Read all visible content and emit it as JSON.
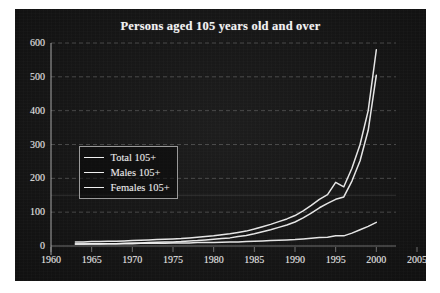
{
  "figure": {
    "background_color": "#ffffff",
    "panel_color": "#151515",
    "ink_color": "#f0f0f0"
  },
  "legend": {
    "position": "inner-left",
    "entries": [
      {
        "label": "Total 105+",
        "color": "#f0f0f0"
      },
      {
        "label": "Males 105+",
        "color": "#f0f0f0"
      },
      {
        "label": "Females 105+",
        "color": "#f0f0f0"
      }
    ]
  },
  "chart_data": {
    "type": "line",
    "title": "Persons aged 105 years old and over",
    "xlabel": "",
    "ylabel": "",
    "xlim": [
      1960,
      2005
    ],
    "ylim": [
      0,
      600
    ],
    "xticks": [
      1960,
      1965,
      1970,
      1975,
      1980,
      1985,
      1990,
      1995,
      2000,
      2005
    ],
    "yticks": [
      0,
      100,
      200,
      300,
      400,
      500,
      600
    ],
    "grid": true,
    "grid_style": "dashed-horizontal",
    "legend_position": "inner-left",
    "x": [
      1963,
      1964,
      1965,
      1966,
      1967,
      1968,
      1969,
      1970,
      1971,
      1972,
      1973,
      1974,
      1975,
      1976,
      1977,
      1978,
      1979,
      1980,
      1981,
      1982,
      1983,
      1984,
      1985,
      1986,
      1987,
      1988,
      1989,
      1990,
      1991,
      1992,
      1993,
      1994,
      1995,
      1996,
      1997,
      1998,
      1999,
      2000
    ],
    "series": [
      {
        "name": "Total 105+",
        "values": [
          12,
          12,
          13,
          13,
          14,
          14,
          15,
          16,
          17,
          18,
          19,
          20,
          21,
          22,
          24,
          26,
          28,
          30,
          33,
          36,
          40,
          44,
          50,
          57,
          64,
          72,
          80,
          90,
          104,
          120,
          138,
          152,
          188,
          175,
          230,
          300,
          400,
          580
        ]
      },
      {
        "name": "Males 105+",
        "values": [
          6,
          6,
          6,
          6,
          7,
          7,
          7,
          7,
          8,
          8,
          8,
          8,
          9,
          9,
          9,
          10,
          10,
          10,
          11,
          12,
          12,
          13,
          14,
          15,
          16,
          17,
          18,
          19,
          21,
          23,
          25,
          26,
          30,
          30,
          38,
          48,
          58,
          70
        ]
      },
      {
        "name": "Females 105+",
        "values": [
          6,
          6,
          7,
          7,
          7,
          7,
          8,
          9,
          9,
          10,
          11,
          12,
          12,
          13,
          15,
          16,
          18,
          20,
          22,
          24,
          28,
          31,
          36,
          42,
          48,
          55,
          62,
          71,
          83,
          97,
          113,
          126,
          138,
          145,
          192,
          252,
          342,
          505
        ]
      }
    ]
  }
}
